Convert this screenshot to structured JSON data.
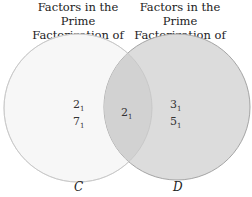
{
  "diagram": {
    "type": "venn",
    "sets": [
      {
        "name": "C",
        "title_line1": "Factors in the Prime",
        "title_line2": "Factorization of 28",
        "only": [
          {
            "base": "2",
            "sub": "1"
          },
          {
            "base": "7",
            "sub": "1"
          }
        ],
        "fill": "#f7f7f7",
        "stroke": "#d8d8d8"
      },
      {
        "name": "D",
        "title_line1": "Factors in the Prime",
        "title_line2": "Factorization of 30",
        "only": [
          {
            "base": "3",
            "sub": "1"
          },
          {
            "base": "5",
            "sub": "1"
          }
        ],
        "fill": "#d9d9d9",
        "stroke": "#a8a8a8"
      }
    ],
    "intersection": [
      {
        "base": "2",
        "sub": "1"
      }
    ]
  }
}
